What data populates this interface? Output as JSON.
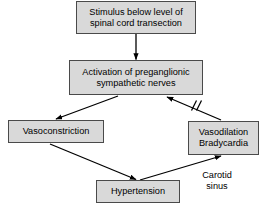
{
  "diagram": {
    "background_color": "#ffffff",
    "node_fill_color": "#d9d9d9",
    "node_border_color": "#4a4a4a",
    "edge_color": "#000000",
    "text_color": "#000000",
    "nodes": [
      {
        "id": "stimulus",
        "label": "Stimulus below level of\nspinal cord transection"
      },
      {
        "id": "activation",
        "label": "Activation of preganglionic\nsympathetic nerves"
      },
      {
        "id": "vasoconstriction",
        "label": "Vasoconstriction"
      },
      {
        "id": "vasodilation",
        "label": "Vasodilation\nBradycardia"
      },
      {
        "id": "hypertension",
        "label": "Hypertension"
      }
    ],
    "labels": [
      {
        "id": "carotid-sinus",
        "text": "Carotid\nsinus"
      }
    ],
    "edges": [
      {
        "id": "stimulus-to-activation",
        "from": "stimulus",
        "to": "activation",
        "type": "arrow"
      },
      {
        "id": "activation-to-vasoconstriction",
        "from": "activation",
        "to": "vasoconstriction",
        "type": "arrow"
      },
      {
        "id": "vasoconstriction-to-hypertension",
        "from": "vasoconstriction",
        "to": "hypertension",
        "type": "arrow"
      },
      {
        "id": "hypertension-to-vasodilation",
        "from": "hypertension",
        "to": "vasodilation",
        "type": "arrow"
      },
      {
        "id": "vasodilation-to-activation",
        "from": "vasodilation",
        "to": "activation",
        "type": "inhibition-arrow",
        "marker": "//"
      }
    ]
  }
}
